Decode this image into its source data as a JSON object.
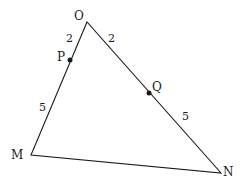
{
  "diagram": {
    "type": "geometry-triangle",
    "vertices": {
      "O": {
        "label": "O",
        "x": 87,
        "y": 22
      },
      "M": {
        "label": "M",
        "x": 31,
        "y": 155
      },
      "N": {
        "label": "N",
        "x": 221,
        "y": 173
      }
    },
    "points": {
      "P": {
        "label": "P",
        "x": 70,
        "y": 60,
        "on_segment": "OM"
      },
      "Q": {
        "label": "Q",
        "x": 149,
        "y": 93,
        "on_segment": "ON"
      }
    },
    "segment_lengths": {
      "OP": "2",
      "PM": "5",
      "OQ": "2",
      "QN": "5"
    },
    "colors": {
      "line": "#1a1a1a",
      "background": "#ffffff"
    }
  }
}
